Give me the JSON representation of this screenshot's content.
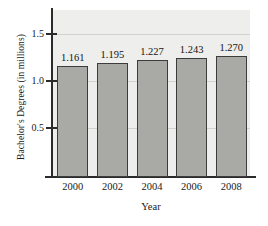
{
  "chart_data": {
    "type": "bar",
    "title": "",
    "xlabel": "Year",
    "ylabel": "Bachelor's Degrees (in millions)",
    "categories": [
      "2000",
      "2002",
      "2004",
      "2006",
      "2008"
    ],
    "values": [
      1.161,
      1.195,
      1.227,
      1.243,
      1.27
    ],
    "value_labels": [
      "1.161",
      "1.195",
      "1.227",
      "1.243",
      "1.270"
    ],
    "ytick_labels": [
      "0.5",
      "1.0",
      "1.5"
    ],
    "ytick_values": [
      0.5,
      1.0,
      1.5
    ],
    "ylim": [
      0.0,
      1.6
    ],
    "xlim_note": "categorical",
    "grid": true,
    "legend": "none",
    "colors": {
      "bar_fill": "#a9a9a6",
      "bar_edge": "#3c3c3c",
      "plot_background": "#eeeeec",
      "gridline": "#d2d2ce",
      "axis": "#2b2b2b",
      "figure_background": "#ffffff",
      "text": "#141414"
    }
  }
}
